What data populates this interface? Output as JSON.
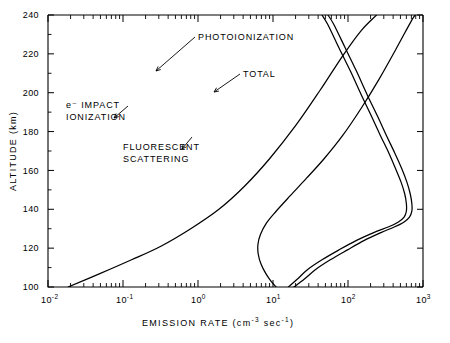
{
  "chart_data": {
    "type": "line",
    "title": "",
    "xlabel": "EMISSION RATE (cm⁻³ sec⁻¹)",
    "ylabel": "ALTITUDE (km)",
    "xscale": "log",
    "yscale": "linear",
    "xlim": [
      0.01,
      1000
    ],
    "ylim": [
      100,
      240
    ],
    "grid": false,
    "legend_position": "inline-annotations",
    "xticklabels": [
      "10⁻²",
      "10⁻¹",
      "10⁰",
      "10¹",
      "10²",
      "10³"
    ],
    "xtickvalues": [
      0.01,
      0.1,
      1,
      10,
      100,
      1000
    ],
    "yticklabels": [
      "100",
      "120",
      "140",
      "160",
      "180",
      "200",
      "220",
      "240"
    ],
    "ytickvalues": [
      100,
      120,
      140,
      160,
      180,
      200,
      220,
      240
    ],
    "series": [
      {
        "name": "e⁻ IMPACT IONIZATION",
        "label": "e⁻ IMPACT\nIONIZATION",
        "points": [
          [
            0.0185,
            100
          ],
          [
            0.05,
            107
          ],
          [
            0.13,
            114
          ],
          [
            0.32,
            121
          ],
          [
            0.8,
            130
          ],
          [
            1.9,
            140
          ],
          [
            4.2,
            152
          ],
          [
            9.0,
            166
          ],
          [
            20.0,
            183
          ],
          [
            42.0,
            201
          ],
          [
            85.0,
            219
          ],
          [
            150.0,
            232
          ],
          [
            240.0,
            240
          ]
        ]
      },
      {
        "name": "FLUORESCENT SCATTERING",
        "label": "FLUORESCENT\nSCATTERING",
        "points": [
          [
            11.0,
            100
          ],
          [
            9.4,
            103
          ],
          [
            8.0,
            107
          ],
          [
            6.9,
            112
          ],
          [
            6.35,
            117
          ],
          [
            6.3,
            122
          ],
          [
            6.8,
            127
          ],
          [
            8.2,
            133
          ],
          [
            11.0,
            139
          ],
          [
            17.0,
            147
          ],
          [
            28.0,
            156
          ],
          [
            48.0,
            166
          ],
          [
            85.0,
            178
          ],
          [
            150.0,
            192
          ],
          [
            260.0,
            207
          ],
          [
            430.0,
            222
          ],
          [
            700.0,
            237
          ],
          [
            790.0,
            240
          ]
        ]
      },
      {
        "name": "PHOTOIONIZATION",
        "label": "PHOTOIONIZATION",
        "points": [
          [
            16.0,
            100
          ],
          [
            21.0,
            104
          ],
          [
            29.0,
            109
          ],
          [
            45.0,
            114
          ],
          [
            75.0,
            119
          ],
          [
            130.0,
            124
          ],
          [
            220.0,
            128
          ],
          [
            350.0,
            131
          ],
          [
            470.0,
            133.5
          ],
          [
            560.0,
            136
          ],
          [
            600.0,
            139
          ],
          [
            600.0,
            143
          ],
          [
            570.0,
            148
          ],
          [
            510.0,
            154
          ],
          [
            430.0,
            161
          ],
          [
            350.0,
            169
          ],
          [
            270.0,
            178
          ],
          [
            205.0,
            188
          ],
          [
            150.0,
            199
          ],
          [
            108.0,
            211
          ],
          [
            76.0,
            223
          ],
          [
            54.0,
            235
          ],
          [
            45.0,
            240
          ]
        ]
      },
      {
        "name": "TOTAL",
        "label": "TOTAL",
        "points": [
          [
            19.0,
            100
          ],
          [
            26.0,
            104
          ],
          [
            37.0,
            109
          ],
          [
            58.0,
            114
          ],
          [
            97.0,
            119
          ],
          [
            165.0,
            124
          ],
          [
            275.0,
            128
          ],
          [
            420.0,
            131
          ],
          [
            560.0,
            133.5
          ],
          [
            660.0,
            136
          ],
          [
            710.0,
            139
          ],
          [
            710.0,
            143
          ],
          [
            675.0,
            148
          ],
          [
            610.0,
            154
          ],
          [
            520.0,
            161
          ],
          [
            420.0,
            169
          ],
          [
            325.0,
            178
          ],
          [
            247.0,
            188
          ],
          [
            180.0,
            199
          ],
          [
            130.0,
            211
          ],
          [
            92.0,
            223
          ],
          [
            65.0,
            235
          ],
          [
            54.0,
            240
          ]
        ]
      }
    ],
    "annotations": [
      {
        "name": "photoionization-label",
        "text": "PHOTOIONIZATION",
        "text_x": 198,
        "text_y": 40,
        "leader": [
          [
            195,
            37
          ],
          [
            156,
            71
          ]
        ]
      },
      {
        "name": "total-label",
        "text": "TOTAL",
        "text_x": 243,
        "text_y": 77,
        "leader": [
          [
            240,
            74
          ],
          [
            214,
            92
          ]
        ]
      },
      {
        "name": "e-impact-ionization-label",
        "line1": "e⁻ IMPACT",
        "line2": "IONIZATION",
        "text_x": 66,
        "text_y": 108,
        "leader": [
          [
            128,
            106
          ],
          [
            114,
            118
          ]
        ]
      },
      {
        "name": "fluorescent-scattering-label",
        "line1": "FLUORESCENT",
        "line2": "SCATTERING",
        "text_x": 123,
        "text_y": 150,
        "leader": [
          [
            192,
            137
          ],
          [
            182,
            149
          ]
        ]
      }
    ]
  },
  "axes": {
    "y_title": "ALTITUDE (km)",
    "x_title_main": "EMISSION RATE (cm",
    "x_title_exp1": "-3",
    "x_title_mid": " sec",
    "x_title_exp2": "-1",
    "x_title_close": ")",
    "x_tick_labels": [
      {
        "mantissa": "10",
        "exponent": "-2"
      },
      {
        "mantissa": "10",
        "exponent": "-1"
      },
      {
        "mantissa": "10",
        "exponent": "0"
      },
      {
        "mantissa": "10",
        "exponent": "1"
      },
      {
        "mantissa": "10",
        "exponent": "2"
      },
      {
        "mantissa": "10",
        "exponent": "3"
      }
    ],
    "y_tick_labels": [
      "240",
      "220",
      "200",
      "180",
      "160",
      "140",
      "120",
      "100"
    ]
  },
  "colors": {
    "background": "#ffffff",
    "ink": "#000000"
  }
}
